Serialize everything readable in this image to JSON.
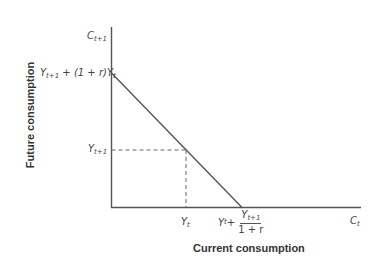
{
  "diagram": {
    "type": "intertemporal-budget-constraint",
    "x_axis": {
      "title": "Current consumption",
      "end_label": {
        "base": "C",
        "sub": "t"
      }
    },
    "y_axis": {
      "title": "Future consumption",
      "end_label": {
        "base": "C",
        "sub": "t+1"
      }
    },
    "y_labels": {
      "intercept": {
        "p1": "Y",
        "s1": "t+1",
        "mid": " + (1 + r)Y",
        "s2": "t"
      },
      "endowment": {
        "base": "Y",
        "sub": "t+1"
      }
    },
    "x_labels": {
      "endowment": {
        "base": "Y",
        "sub": "t"
      },
      "intercept": {
        "lead_base": "Y",
        "lead_sub": "t",
        "plus": " +",
        "num_base": "Y",
        "num_sub": "t+1",
        "den": "1 + r"
      }
    },
    "colors": {
      "axis": "#555555",
      "budget_line": "#555555",
      "dashed": "#666666"
    }
  }
}
